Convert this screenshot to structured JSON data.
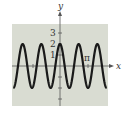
{
  "chart_data": {
    "type": "line",
    "title": "",
    "function": "y = 2cos(3x)",
    "xlabel": "x",
    "ylabel": "y",
    "x_tick_labels": [
      "π"
    ],
    "y_tick_labels": [
      "3",
      "2",
      "1"
    ],
    "xlim": [
      -5.236,
      5.236
    ],
    "ylim": [
      -3,
      3
    ],
    "grid": false,
    "legend": null,
    "series": [
      {
        "name": "curve",
        "amplitude": 2,
        "period": "2π/3",
        "x": [
          -5.236,
          -4.189,
          -3.142,
          -2.094,
          -1.047,
          0,
          1.047,
          2.094,
          3.142,
          4.189,
          5.236
        ],
        "values": [
          -2,
          2,
          -2,
          2,
          -2,
          2,
          -2,
          2,
          -2,
          2,
          -2
        ]
      }
    ],
    "colors": {
      "background": "#d9dcd2",
      "curve": "#1a1a1a",
      "axis": "#444444"
    }
  },
  "labels": {
    "x_axis": "x",
    "y_axis": "y",
    "y3": "3",
    "y2": "2",
    "y1": "1",
    "pi": "π"
  }
}
